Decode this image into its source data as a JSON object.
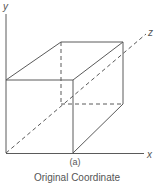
{
  "figure": {
    "sub_label": "(a)",
    "caption": "Original Coordinate",
    "line_color": "#5a5a5a",
    "axes": {
      "x_label": "x",
      "y_label": "y",
      "z_label": "z"
    },
    "cube": {
      "front_face": "solid",
      "hidden_edges": "dashed"
    }
  }
}
